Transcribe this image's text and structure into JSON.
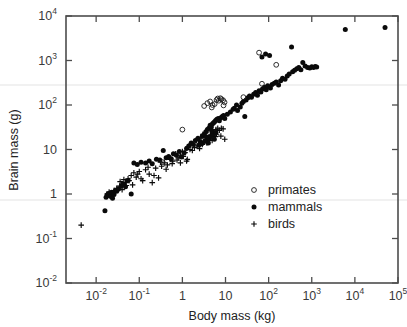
{
  "chart_data": {
    "type": "scatter",
    "title": "",
    "xlabel": "Body mass (kg)",
    "ylabel": "Brain mass (g)",
    "xscale": "log",
    "yscale": "log",
    "xlim": [
      0.002,
      100000
    ],
    "ylim": [
      0.01,
      10000
    ],
    "grid": false,
    "legend_position": "inside-lower-right",
    "xticks": [
      {
        "value": 0.01,
        "label": "10",
        "exp": "-2"
      },
      {
        "value": 0.1,
        "label": "10",
        "exp": "-1"
      },
      {
        "value": 1,
        "label": "1",
        "exp": ""
      },
      {
        "value": 10,
        "label": "10",
        "exp": ""
      },
      {
        "value": 100,
        "label": "10",
        "exp": "2"
      },
      {
        "value": 1000,
        "label": "10",
        "exp": "3"
      },
      {
        "value": 10000,
        "label": "10",
        "exp": "4"
      },
      {
        "value": 100000,
        "label": "10",
        "exp": "5"
      }
    ],
    "yticks": [
      {
        "value": 10000,
        "label": "10",
        "exp": "4"
      },
      {
        "value": 1000,
        "label": "10",
        "exp": "3"
      },
      {
        "value": 100,
        "label": "10",
        "exp": "2"
      },
      {
        "value": 10,
        "label": "10",
        "exp": ""
      },
      {
        "value": 1,
        "label": "1",
        "exp": ""
      },
      {
        "value": 0.1,
        "label": "10",
        "exp": "-1"
      },
      {
        "value": 0.01,
        "label": "10",
        "exp": "-2"
      }
    ],
    "series": [
      {
        "name": "primates",
        "marker": "open-circle",
        "color": "#1a1a1a",
        "points": [
          [
            1.0,
            28
          ],
          [
            3.2,
            95
          ],
          [
            3.8,
            110
          ],
          [
            4.4,
            120
          ],
          [
            5.0,
            100
          ],
          [
            6.2,
            130
          ],
          [
            7.0,
            125
          ],
          [
            8.0,
            135
          ],
          [
            8.8,
            128
          ],
          [
            9.5,
            115
          ],
          [
            6.6,
            140
          ],
          [
            5.6,
            105
          ],
          [
            0.35,
            5.2
          ],
          [
            26,
            150
          ],
          [
            60,
            1500
          ],
          [
            70,
            300
          ],
          [
            150,
            800
          ],
          [
            4.8,
            88
          ],
          [
            7.6,
            142
          ],
          [
            9.0,
            98
          ]
        ]
      },
      {
        "name": "mammals",
        "marker": "filled-circle",
        "color": "#0a0a0a",
        "points": [
          [
            0.016,
            0.42
          ],
          [
            0.018,
            0.95
          ],
          [
            0.017,
            0.85
          ],
          [
            0.019,
            1.0
          ],
          [
            0.02,
            0.92
          ],
          [
            0.021,
            1.05
          ],
          [
            0.022,
            0.88
          ],
          [
            0.023,
            1.1
          ],
          [
            0.024,
            0.8
          ],
          [
            0.026,
            0.98
          ],
          [
            0.028,
            1.2
          ],
          [
            0.03,
            1.15
          ],
          [
            0.033,
            1.3
          ],
          [
            0.038,
            1.5
          ],
          [
            0.042,
            1.7
          ],
          [
            0.048,
            1.45
          ],
          [
            0.055,
            2.0
          ],
          [
            0.065,
            1.0
          ],
          [
            0.075,
            5.0
          ],
          [
            0.09,
            4.6
          ],
          [
            0.11,
            5.2
          ],
          [
            0.14,
            5.0
          ],
          [
            0.17,
            5.5
          ],
          [
            0.2,
            4.8
          ],
          [
            0.25,
            6.0
          ],
          [
            0.3,
            5.8
          ],
          [
            0.36,
            9.5
          ],
          [
            0.42,
            6.5
          ],
          [
            0.48,
            7.0
          ],
          [
            0.55,
            6.2
          ],
          [
            0.62,
            8.0
          ],
          [
            0.72,
            7.5
          ],
          [
            0.85,
            9.0
          ],
          [
            0.95,
            6.8
          ],
          [
            1.1,
            8.5
          ],
          [
            1.25,
            10.5
          ],
          [
            1.4,
            12.0
          ],
          [
            1.6,
            14.0
          ],
          [
            1.8,
            13.0
          ],
          [
            2.0,
            16.0
          ],
          [
            2.3,
            18.0
          ],
          [
            2.6,
            15.0
          ],
          [
            2.9,
            20.0
          ],
          [
            3.2,
            22.0
          ],
          [
            3.5,
            25.0
          ],
          [
            3.8,
            28.0
          ],
          [
            4.1,
            30.0
          ],
          [
            4.4,
            35.0
          ],
          [
            4.7,
            32.0
          ],
          [
            5.0,
            38.0
          ],
          [
            5.3,
            40.0
          ],
          [
            5.6,
            42.0
          ],
          [
            5.9,
            45.0
          ],
          [
            6.3,
            48.0
          ],
          [
            6.8,
            50.0
          ],
          [
            7.2,
            44.0
          ],
          [
            7.8,
            52.0
          ],
          [
            8.4,
            55.0
          ],
          [
            9.0,
            58.0
          ],
          [
            9.6,
            50.0
          ],
          [
            4.2,
            18.0
          ],
          [
            4.6,
            20.0
          ],
          [
            3.9,
            16.0
          ],
          [
            5.2,
            22.0
          ],
          [
            4.0,
            14.0
          ],
          [
            4.8,
            26.0
          ],
          [
            3.6,
            19.0
          ],
          [
            5.5,
            17.0
          ],
          [
            6.0,
            24.0
          ],
          [
            2.8,
            13.5
          ],
          [
            3.3,
            15.5
          ],
          [
            2.4,
            12.5
          ],
          [
            11,
            62
          ],
          [
            13,
            70
          ],
          [
            16,
            85
          ],
          [
            19,
            75
          ],
          [
            22,
            90
          ],
          [
            28,
            55
          ],
          [
            30,
            130
          ],
          [
            33,
            145
          ],
          [
            36,
            160
          ],
          [
            40,
            150
          ],
          [
            45,
            175
          ],
          [
            50,
            190
          ],
          [
            55,
            165
          ],
          [
            60,
            210
          ],
          [
            66,
            195
          ],
          [
            72,
            230
          ],
          [
            80,
            250
          ],
          [
            88,
            220
          ],
          [
            95,
            270
          ],
          [
            105,
            1300
          ],
          [
            110,
            240
          ],
          [
            120,
            290
          ],
          [
            135,
            310
          ],
          [
            150,
            330
          ],
          [
            170,
            280
          ],
          [
            190,
            350
          ],
          [
            210,
            400
          ],
          [
            240,
            380
          ],
          [
            270,
            450
          ],
          [
            300,
            500
          ],
          [
            340,
            2000
          ],
          [
            360,
            560
          ],
          [
            400,
            600
          ],
          [
            450,
            650
          ],
          [
            500,
            700
          ],
          [
            560,
            620
          ],
          [
            620,
            900
          ],
          [
            700,
            750
          ],
          [
            800,
            700
          ],
          [
            900,
            680
          ],
          [
            1000,
            720
          ],
          [
            1100,
            700
          ],
          [
            1200,
            730
          ],
          [
            1300,
            710
          ],
          [
            6000,
            5000
          ],
          [
            50000,
            5500
          ],
          [
            70,
            1200
          ],
          [
            85,
            1400
          ],
          [
            26,
            120
          ],
          [
            24,
            110
          ],
          [
            18,
            100
          ],
          [
            15,
            80
          ]
        ]
      },
      {
        "name": "birds",
        "marker": "plus",
        "color": "#0a0a0a",
        "points": [
          [
            0.0045,
            0.2
          ],
          [
            0.018,
            1.0
          ],
          [
            0.02,
            1.1
          ],
          [
            0.023,
            0.95
          ],
          [
            0.026,
            1.2
          ],
          [
            0.03,
            1.35
          ],
          [
            0.035,
            1.5
          ],
          [
            0.04,
            1.25
          ],
          [
            0.048,
            1.8
          ],
          [
            0.055,
            2.2
          ],
          [
            0.065,
            2.6
          ],
          [
            0.075,
            3.0
          ],
          [
            0.085,
            2.4
          ],
          [
            0.1,
            3.2
          ],
          [
            0.12,
            2.0
          ],
          [
            0.14,
            3.5
          ],
          [
            0.17,
            2.8
          ],
          [
            0.2,
            1.8
          ],
          [
            0.24,
            3.8
          ],
          [
            0.28,
            2.3
          ],
          [
            0.33,
            4.2
          ],
          [
            0.38,
            5.0
          ],
          [
            0.45,
            4.5
          ],
          [
            0.52,
            6.0
          ],
          [
            0.6,
            5.5
          ],
          [
            0.7,
            8.0
          ],
          [
            0.8,
            6.5
          ],
          [
            0.9,
            7.5
          ],
          [
            1.0,
            9.0
          ],
          [
            1.15,
            8.5
          ],
          [
            1.3,
            6.0
          ],
          [
            1.5,
            10.0
          ],
          [
            1.7,
            9.5
          ],
          [
            1.9,
            11.0
          ],
          [
            2.2,
            12.0
          ],
          [
            2.5,
            10.5
          ],
          [
            2.9,
            13.0
          ],
          [
            3.3,
            15.0
          ],
          [
            3.7,
            14.0
          ],
          [
            4.2,
            17.0
          ],
          [
            4.6,
            20.0
          ],
          [
            5.0,
            23.0
          ],
          [
            5.5,
            25.0
          ],
          [
            6.0,
            28.0
          ],
          [
            6.6,
            30.0
          ],
          [
            7.2,
            27.0
          ],
          [
            8.0,
            30.0
          ],
          [
            8.8,
            29.0
          ],
          [
            9.6,
            17.0
          ],
          [
            3.0,
            22.0
          ],
          [
            2.7,
            18.0
          ],
          [
            2.1,
            16.0
          ],
          [
            1.6,
            13.5
          ],
          [
            1.35,
            11.5
          ],
          [
            1.05,
            7.0
          ],
          [
            0.75,
            5.8
          ],
          [
            0.58,
            4.8
          ],
          [
            0.42,
            3.6
          ],
          [
            0.31,
            5.2
          ],
          [
            0.22,
            2.6
          ],
          [
            0.16,
            4.0
          ],
          [
            0.11,
            2.2
          ],
          [
            0.092,
            2.8
          ],
          [
            0.07,
            1.6
          ],
          [
            0.058,
            2.0
          ],
          [
            0.044,
            2.1
          ],
          [
            0.036,
            1.9
          ],
          [
            0.05,
            1.55
          ],
          [
            4.0,
            19.0
          ],
          [
            4.9,
            16.0
          ],
          [
            5.8,
            19.5
          ],
          [
            7.8,
            20.0
          ],
          [
            6.2,
            22.0
          ],
          [
            3.5,
            24.0
          ],
          [
            0.9,
            5.0
          ],
          [
            1.25,
            5.5
          ]
        ]
      }
    ]
  },
  "legend": {
    "items": [
      {
        "label": "primates",
        "marker": "open-circle"
      },
      {
        "label": "mammals",
        "marker": "filled-circle"
      },
      {
        "label": "birds",
        "marker": "plus"
      }
    ]
  }
}
